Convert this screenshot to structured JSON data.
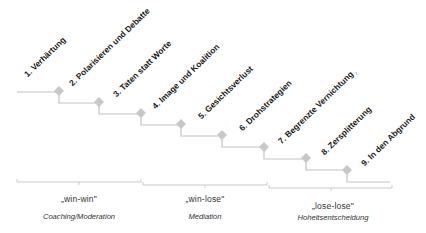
{
  "colors": {
    "line": "#c4c4c4",
    "diamond": "#c8c8c8",
    "bracket": "#c9c9c9",
    "label_text": "#1a1a1a",
    "phase_text": "#333333"
  },
  "stages": [
    {
      "label": "1. Verhärtung"
    },
    {
      "label": "2. Polarisieren und Debatte"
    },
    {
      "label": "3. Taten statt Worte"
    },
    {
      "label": "4. Image und Koalition"
    },
    {
      "label": "5. Gesichtsverlust"
    },
    {
      "label": "6. Drohstrategien"
    },
    {
      "label": "7. Begrenzte Vernichtung"
    },
    {
      "label": "8. Zersplitterung"
    },
    {
      "label": "9. In den Abgrund"
    }
  ],
  "phases": [
    {
      "type": "„win-win\"",
      "method": "Coaching/Moderation"
    },
    {
      "type": "„win-lose\"",
      "method": "Mediation"
    },
    {
      "type": "„lose-lose\"",
      "method": "Hoheitsentscheidung"
    }
  ]
}
